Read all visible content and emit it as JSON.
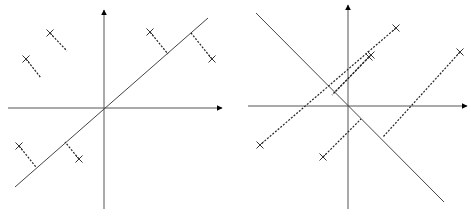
{
  "figure": {
    "panels": [
      {
        "name": "left-panel",
        "description": "Projection onto principal axis (perpendicular residuals)",
        "axes": {
          "origin": [
            104,
            108
          ],
          "x_start": 8,
          "x_end": 222,
          "y_top": 10,
          "y_bottom": 209
        },
        "line": {
          "from": [
            15,
            187
          ],
          "to": [
            208,
            18
          ]
        },
        "points": [
          {
            "p": [
              50,
              33
            ],
            "foot": [
              67,
              51
            ]
          },
          {
            "p": [
              26,
              59
            ],
            "foot": [
              41,
              78
            ]
          },
          {
            "p": [
              150,
              32
            ],
            "foot": [
              168,
              54
            ]
          },
          {
            "p": [
              212,
              59
            ],
            "foot": [
              191,
              33
            ]
          },
          {
            "p": [
              19,
              146
            ],
            "foot": [
              36,
              167
            ]
          },
          {
            "p": [
              79,
              159
            ],
            "foot": [
              65,
              142
            ]
          }
        ]
      },
      {
        "name": "right-panel",
        "description": "Projection onto orthogonal axis",
        "axes": {
          "origin": [
            348,
            106
          ],
          "x_start": 248,
          "x_end": 467,
          "y_top": 5,
          "y_bottom": 209
        },
        "line": {
          "from": [
            256,
            13
          ],
          "to": [
            444,
            202
          ]
        },
        "segments": [
          {
            "from": [
              396,
              28
            ],
            "to": [
              260,
              145
            ]
          },
          {
            "from": [
              371,
              55
            ],
            "to": [
              334,
              93
            ]
          },
          {
            "from": [
              369,
              57
            ],
            "to": [
              332,
              95
            ]
          },
          {
            "from": [
              460,
              52
            ],
            "to": [
              383,
              137
            ]
          },
          {
            "from": [
              323,
              157
            ],
            "to": [
              361,
              119
            ]
          }
        ],
        "points": [
          [
            396,
            28
          ],
          [
            371,
            55
          ],
          [
            369,
            57
          ],
          [
            460,
            52
          ],
          [
            260,
            145
          ],
          [
            323,
            157
          ]
        ]
      }
    ]
  }
}
